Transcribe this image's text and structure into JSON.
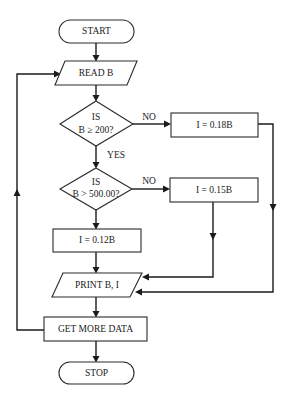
{
  "diagram": {
    "type": "flowchart",
    "nodes": {
      "start": {
        "shape": "terminator",
        "label": "START"
      },
      "read": {
        "shape": "input-output",
        "label": "READ B"
      },
      "decision1": {
        "shape": "decision",
        "line1": "IS",
        "line2": "B ≥ 200?"
      },
      "rate18": {
        "shape": "process",
        "label": "I = 0.18B"
      },
      "decision2": {
        "shape": "decision",
        "line1": "IS",
        "line2": "B > 500.00?"
      },
      "rate15": {
        "shape": "process",
        "label": "I = 0.15B"
      },
      "rate12": {
        "shape": "process",
        "label": "I = 0.12B"
      },
      "print": {
        "shape": "input-output",
        "label": "PRINT B, I"
      },
      "more": {
        "shape": "process",
        "label": "GET MORE DATA"
      },
      "stop": {
        "shape": "terminator",
        "label": "STOP"
      }
    },
    "edges": [
      {
        "from": "start",
        "to": "read",
        "label": ""
      },
      {
        "from": "read",
        "to": "decision1",
        "label": ""
      },
      {
        "from": "decision1",
        "to": "rate18",
        "label": "NO"
      },
      {
        "from": "decision1",
        "to": "decision2",
        "label": "YES"
      },
      {
        "from": "decision2",
        "to": "rate15",
        "label": "NO"
      },
      {
        "from": "decision2",
        "to": "rate12",
        "label": ""
      },
      {
        "from": "rate12",
        "to": "print",
        "label": ""
      },
      {
        "from": "rate15",
        "to": "print",
        "label": ""
      },
      {
        "from": "rate18",
        "to": "print",
        "label": ""
      },
      {
        "from": "print",
        "to": "more",
        "label": ""
      },
      {
        "from": "more",
        "to": "read",
        "label": ""
      },
      {
        "from": "more",
        "to": "stop",
        "label": ""
      }
    ],
    "edge_labels": {
      "d1_no": "NO",
      "d1_yes": "YES",
      "d2_no": "NO"
    },
    "colors": {
      "stroke": "#1a1a1a",
      "fill": "#ffffff",
      "text": "#222222"
    }
  }
}
